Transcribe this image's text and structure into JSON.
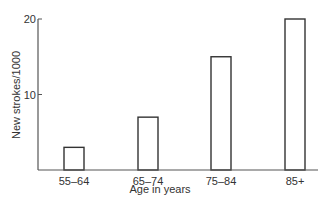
{
  "chart_data": {
    "type": "bar",
    "title": "",
    "xlabel": "Age in years",
    "ylabel": "New strokes/1000",
    "categories": [
      "55–64",
      "65–74",
      "75–84",
      "85+"
    ],
    "values": [
      3,
      7,
      15,
      20
    ],
    "ylim": [
      0,
      20
    ],
    "yticks": [
      10,
      20
    ],
    "ytick_labels": [
      "10",
      "20"
    ],
    "grid": false,
    "legend": null,
    "bar_style": "outline"
  },
  "colors": {
    "axis": "#555555",
    "bar_outline": "#333333",
    "bar_fill": "#ffffff",
    "text": "#333333"
  }
}
